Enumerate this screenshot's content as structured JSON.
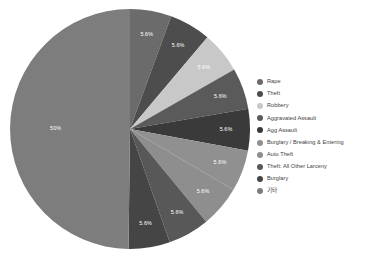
{
  "chart_data": {
    "type": "pie",
    "title": "",
    "subtitle": "",
    "xlabel": "",
    "ylabel": "",
    "legend_position": "right",
    "grid": false,
    "start_angle_deg": 0,
    "direction": "clockwise",
    "categories": [
      "Rape",
      "Theft",
      "Robbery",
      "Aggravated Assault",
      "Agg Assault",
      "Burglary / Breaking & Entering",
      "Auto Theft",
      "Theft: All Other Larceny",
      "Burglary",
      "기타"
    ],
    "values": [
      5.6,
      5.6,
      5.6,
      5.6,
      5.6,
      5.6,
      5.6,
      5.6,
      5.6,
      50.0
    ],
    "value_labels": [
      "5.6%",
      "5.6%",
      "5.6%",
      "5.6%",
      "5.6%",
      "5.6%",
      "5.6%",
      "5.6%",
      "5.6%",
      "50%"
    ],
    "colors": [
      "#6b6b6b",
      "#4d4d4d",
      "#c8c8c8",
      "#5a5a5a",
      "#3a3a3a",
      "#909090",
      "#8e8e8e",
      "#585858",
      "#454545",
      "#7d7d7d"
    ],
    "unit": "%"
  },
  "legend": {
    "items": [
      {
        "label": "Rape",
        "color": "#6b6b6b"
      },
      {
        "label": "Theft",
        "color": "#4d4d4d"
      },
      {
        "label": "Robbery",
        "color": "#c8c8c8"
      },
      {
        "label": "Aggravated Assault",
        "color": "#5a5a5a"
      },
      {
        "label": "Agg Assault",
        "color": "#3a3a3a"
      },
      {
        "label": "Burglary / Breaking & Entering",
        "color": "#909090"
      },
      {
        "label": "Auto Theft",
        "color": "#8e8e8e"
      },
      {
        "label": "Theft: All Other Larceny",
        "color": "#585858"
      },
      {
        "label": "Burglary",
        "color": "#454545"
      },
      {
        "label": "기타",
        "color": "#7d7d7d"
      }
    ]
  }
}
